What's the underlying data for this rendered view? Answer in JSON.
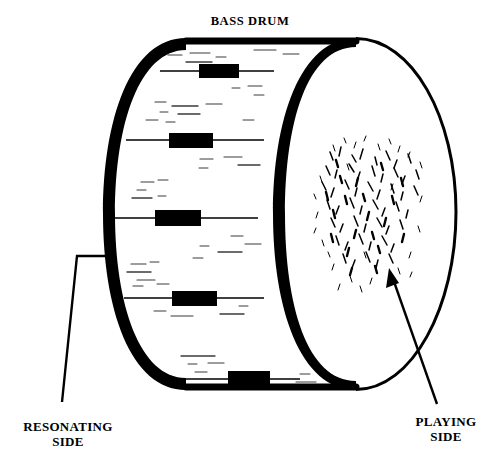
{
  "figure": {
    "type": "technical-line-diagram",
    "subject": "bass drum",
    "title": "BASS DRUM",
    "background_color": "#ffffff",
    "ink_color": "#000000",
    "width": 497,
    "height": 472
  },
  "title": {
    "text": "BASS DRUM",
    "x": 250,
    "y": 26
  },
  "callouts": [
    {
      "id": "resonating",
      "line1": "RESONATING",
      "line2": "SIDE",
      "text_x": 68,
      "text_y1": 430,
      "text_y2": 445,
      "leader": "M 105,256 L 77,256 L 62,400",
      "points_to": "drum-shell-rim-left"
    },
    {
      "id": "playing",
      "line1": "PLAYING",
      "line2": "SIDE",
      "text_x": 445,
      "text_y1": 425,
      "text_y2": 440,
      "leader": "M 437,402 L 391,273",
      "arrow_head": "M 391,273 L 388,288 L 399,284 Z",
      "points_to": "playing-head-wear-patch"
    }
  ],
  "drum": {
    "shell": {
      "name": "drum-shell",
      "description": "cylindrical shell drawn in perspective, heavy black rim outline",
      "rim_thickness_px": 12,
      "left_rim_cx": 186,
      "left_rim_cy": 214,
      "left_rim_rx": 83,
      "left_rim_ry": 176
    },
    "playing_head": {
      "name": "playing-head",
      "description": "large front drumhead ellipse, batter side facing viewer",
      "cx": 356,
      "cy": 212,
      "rx": 100,
      "ry": 174
    },
    "wear_patch": {
      "name": "beater-wear-patch",
      "description": "scribbled texture where the beater strikes the playing head",
      "cx": 370,
      "cy": 205,
      "rx": 46,
      "ry": 58,
      "stroke_count": 260
    },
    "tension_rods": [
      {
        "index": 1,
        "x": 199,
        "y": 68,
        "w": 40,
        "h": 14,
        "line_y": 70,
        "line_x1": 160,
        "line_x2": 272
      },
      {
        "index": 2,
        "x": 169,
        "y": 133,
        "w": 44,
        "h": 15,
        "line_y": 140,
        "line_x1": 126,
        "line_x2": 262
      },
      {
        "index": 3,
        "x": 155,
        "y": 210,
        "w": 46,
        "h": 16,
        "line_y": 217,
        "line_x1": 112,
        "line_x2": 256
      },
      {
        "index": 4,
        "x": 172,
        "y": 291,
        "w": 45,
        "h": 15,
        "line_y": 298,
        "line_x1": 125,
        "line_x2": 262
      },
      {
        "index": 5,
        "x": 228,
        "y": 370,
        "w": 42,
        "h": 14,
        "line_y": 378,
        "line_x1": 163,
        "line_x2": 296
      }
    ]
  },
  "shell_texture": {
    "description": "light horizontal scratch marks suggesting shell grain on the inside of the resonating head",
    "mark_count": 46
  }
}
